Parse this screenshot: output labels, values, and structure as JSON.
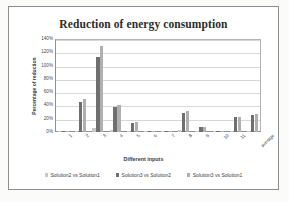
{
  "chart_data": {
    "type": "bar",
    "title": "Reduction of energy consumption",
    "xlabel": "Different inputs",
    "ylabel": "Percentage of reduction",
    "categories": [
      "1",
      "2",
      "3",
      "4",
      "5",
      "6",
      "7",
      "8",
      "9",
      "10",
      "11",
      "average"
    ],
    "series": [
      {
        "name": "Solution2 vs Solution1",
        "color": "#c9c9c9",
        "values": [
          1,
          2,
          6,
          3,
          1,
          1,
          1,
          3,
          1,
          1,
          2,
          2
        ]
      },
      {
        "name": "Solution3 vs Solution2",
        "color": "#6f6f6f",
        "values": [
          0,
          45,
          113,
          37,
          14,
          1,
          1,
          28,
          7,
          1,
          22,
          25
        ]
      },
      {
        "name": "Solution3 vs Solution1",
        "color": "#b0b0b0",
        "values": [
          1,
          50,
          130,
          40,
          15,
          1,
          1,
          31,
          8,
          2,
          23,
          27
        ]
      }
    ],
    "ylim": [
      0,
      140
    ],
    "yticks": [
      "0%",
      "20%",
      "40%",
      "60%",
      "80%",
      "100%",
      "120%",
      "140%"
    ],
    "ytick_values": [
      0,
      20,
      40,
      60,
      80,
      100,
      120,
      140
    ],
    "grid": true,
    "legend_position": "bottom"
  }
}
